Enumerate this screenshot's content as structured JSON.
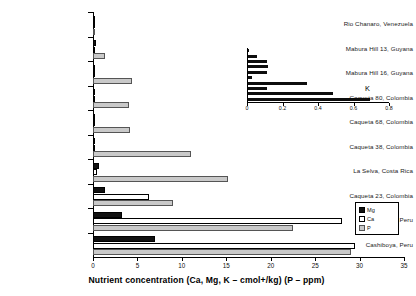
{
  "chart_data": {
    "type": "bar",
    "orientation": "horizontal",
    "title": "",
    "xlabel": "Nutrient concentration (Ca, Mg, K – cmol+/kg) (P – ppm)",
    "ylabel": "",
    "xlim": [
      0,
      35
    ],
    "xticks": [
      0,
      5,
      10,
      15,
      20,
      25,
      30,
      35
    ],
    "xtick_labels": [
      "0",
      "5",
      "10",
      "15",
      "20",
      "25",
      "30",
      "35"
    ],
    "grid": false,
    "legend_position": "right",
    "categories": [
      "Rio Chanaro, Venezuela",
      "Mabura Hill 13, Guyana",
      "Mabura Hill 16, Guyana",
      "Caqueta 80, Colombia",
      "Caqueta 68, Colombia",
      "Caqueta 38, Colombia",
      "La Selva, Costa Rica",
      "Caqueta 23, Colombia",
      "Aguaytia, Peru",
      "Cashiboya, Peru"
    ],
    "series": [
      {
        "name": "Mg",
        "color": "#111111",
        "values": [
          0.05,
          0.3,
          0.12,
          0.25,
          0.2,
          0.18,
          0.7,
          1.3,
          3.3,
          7.0
        ]
      },
      {
        "name": "Ca",
        "color": "#ffffff",
        "values": [
          0.04,
          0.05,
          0.1,
          0.1,
          0.08,
          0.12,
          0.5,
          6.3,
          28.0,
          29.5
        ]
      },
      {
        "name": "P",
        "color": "#c9c9c9",
        "values": [
          0.1,
          1.3,
          4.4,
          4.0,
          4.2,
          11.0,
          15.2,
          9.0,
          22.5,
          29.0
        ]
      }
    ],
    "legend_entries": [
      "Mg",
      "Ca",
      "P"
    ]
  },
  "inset_chart": {
    "type": "bar",
    "orientation": "horizontal",
    "title": "K",
    "xlim": [
      0,
      0.8
    ],
    "xticks": [
      0,
      0.2,
      0.4,
      0.6,
      0.8
    ],
    "xtick_labels": [
      "0",
      "0.2",
      "0.4",
      "0.6",
      "0.8"
    ],
    "grid": false,
    "series_name": "K",
    "color": "#0d0d0d",
    "categories": [
      "Rio Chanaro, Venezuela",
      "Mabura Hill 13, Guyana",
      "Mabura Hill 16, Guyana",
      "Caqueta 80, Colombia",
      "Caqueta 68, Colombia",
      "Caqueta 38, Colombia",
      "La Selva, Costa Rica",
      "Caqueta 23, Colombia",
      "Aguaytia, Peru",
      "Cashiboya, Peru"
    ],
    "values": [
      0.005,
      0.05,
      0.105,
      0.11,
      0.105,
      0.025,
      0.33,
      0.105,
      0.48,
      0.69
    ]
  },
  "legend": {
    "items": [
      {
        "label": "Mg",
        "color": "#111111"
      },
      {
        "label": "Ca",
        "color": "#ffffff"
      },
      {
        "label": "P",
        "color": "#c9c9c9"
      }
    ]
  }
}
